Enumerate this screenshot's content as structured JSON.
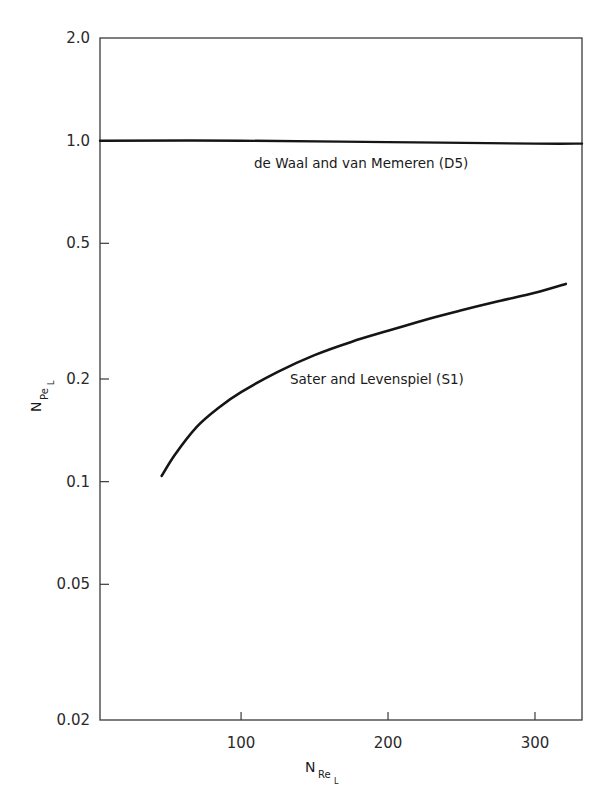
{
  "chart_data": {
    "type": "line",
    "title": "",
    "xlabel": "N_Re_L",
    "ylabel": "N_Pe_L",
    "xlabel_main": "N",
    "xlabel_sub": "Re",
    "xlabel_subsub": "L",
    "ylabel_main": "N",
    "ylabel_sub": "Pe",
    "ylabel_subsub": "L",
    "xscale": "linear",
    "yscale": "log",
    "xlim": [
      4,
      332
    ],
    "ylim": [
      0.02,
      2.0
    ],
    "grid": false,
    "legend": "none (inline annotations)",
    "x_ticks": [
      100,
      200,
      300
    ],
    "x_tick_labels": [
      "100",
      "200",
      "300"
    ],
    "y_ticks": [
      0.02,
      0.05,
      0.1,
      0.2,
      0.5,
      1.0,
      2.0
    ],
    "y_tick_labels": [
      "0.02",
      "0.05",
      "0.1",
      "0.2",
      "0.5",
      "1.0",
      "2.0"
    ],
    "series": [
      {
        "name": "de Waal and van Memeren (D5)",
        "x": [
          4,
          100,
          200,
          300,
          332
        ],
        "y": [
          1.0,
          1.0,
          0.99,
          0.98,
          0.98
        ]
      },
      {
        "name": "Sater and Levenspiel (S1)",
        "x": [
          46,
          55,
          70,
          85,
          100,
          125,
          150,
          175,
          200,
          225,
          250,
          275,
          300,
          321
        ],
        "y": [
          0.104,
          0.12,
          0.145,
          0.165,
          0.183,
          0.21,
          0.235,
          0.257,
          0.277,
          0.298,
          0.318,
          0.338,
          0.358,
          0.38
        ]
      }
    ],
    "annotations": [
      {
        "text": "de Waal and van Memeren (D5)",
        "x": 200,
        "y": 0.84
      },
      {
        "text": "Sater and Levenspiel (S1)",
        "x": 215,
        "y": 0.2
      }
    ]
  }
}
